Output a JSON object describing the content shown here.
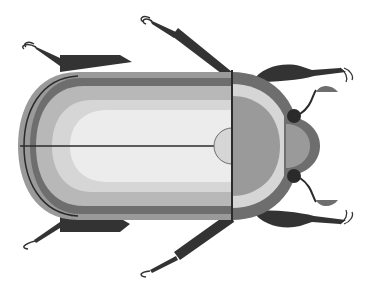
{
  "illustration": {
    "subject": "Beetle (top view)",
    "style": "flat grayscale",
    "colors": {
      "background": "#ffffff",
      "dark": "#333333",
      "darker": "#2a2a2a",
      "mid_dark": "#6e6e6e",
      "mid": "#9a9a9a",
      "light_mid": "#b8b8b8",
      "light": "#d6d6d6",
      "lightest": "#ececec",
      "line": "#2b2b2b"
    }
  }
}
